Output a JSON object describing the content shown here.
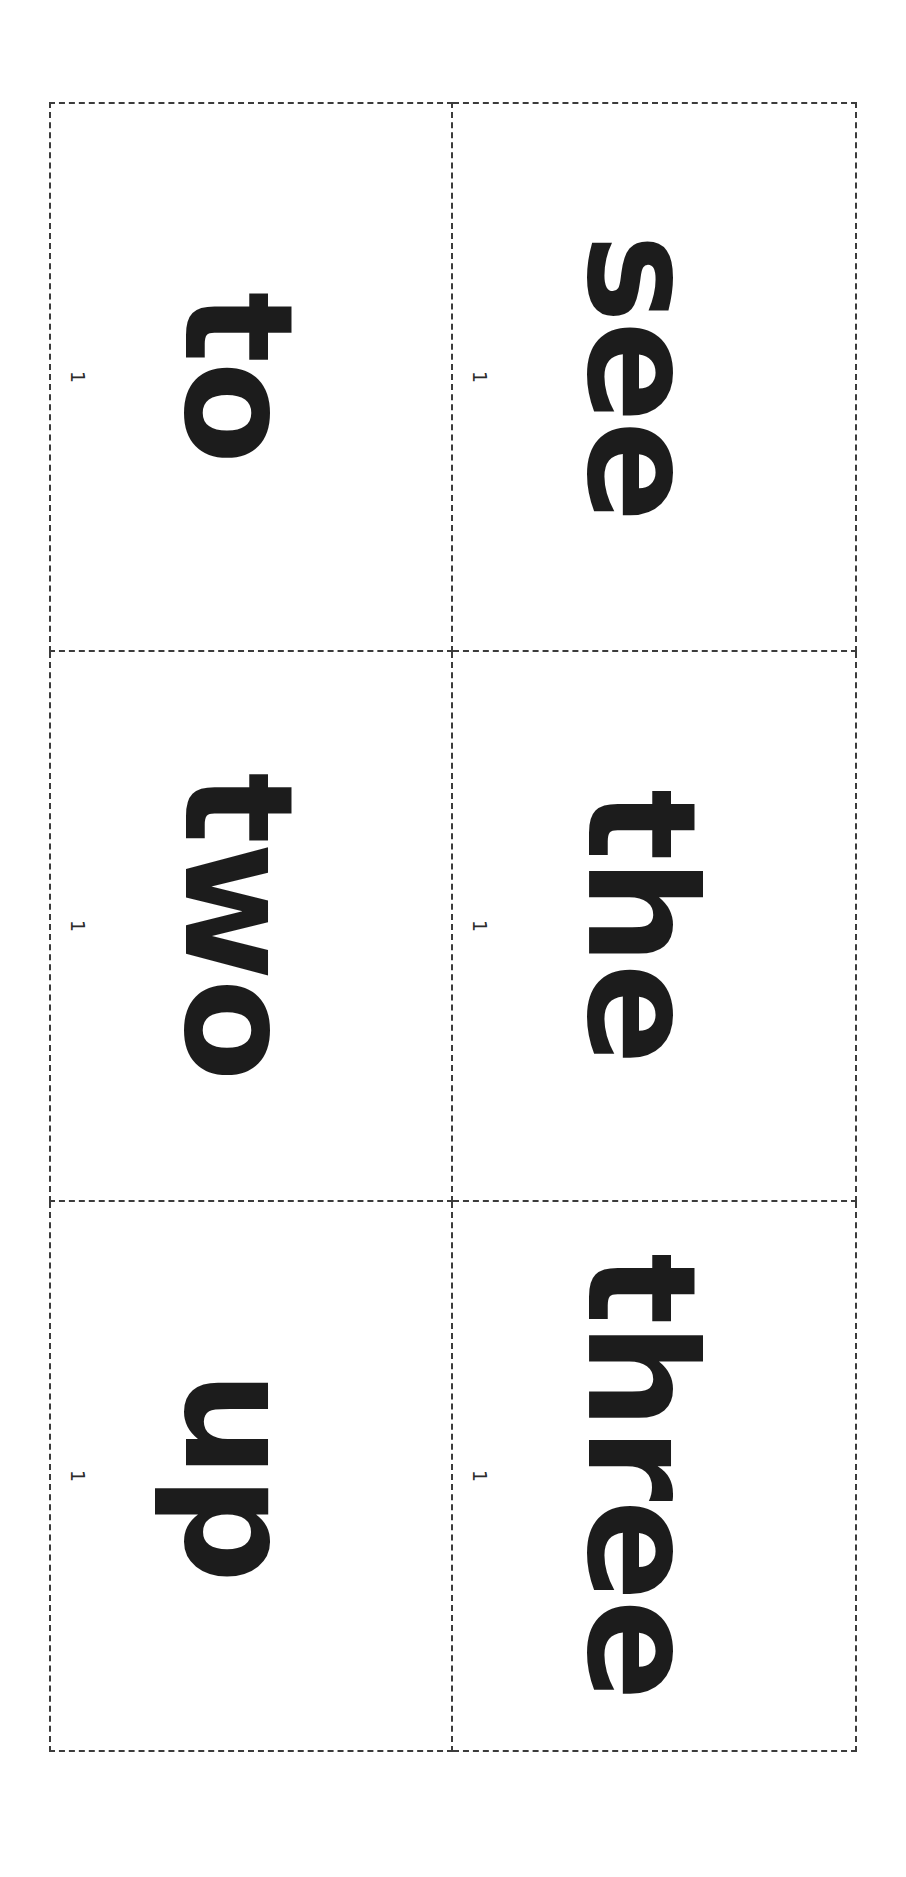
{
  "document": {
    "kind": "sight-word-flashcard-sheet",
    "orientation": "landscape-printed-rotated",
    "page_marker": "1",
    "ink_color": "#1c1c1c",
    "cut_line_color": "#3c3c3c",
    "background_color": "#ffffff",
    "grid": {
      "columns": 2,
      "rows": 3
    }
  },
  "cards": [
    {
      "word": "to",
      "row": 0,
      "column": 0,
      "marker": "1"
    },
    {
      "word": "see",
      "row": 0,
      "column": 1,
      "marker": "1"
    },
    {
      "word": "two",
      "row": 1,
      "column": 0,
      "marker": "1"
    },
    {
      "word": "the",
      "row": 1,
      "column": 1,
      "marker": "1"
    },
    {
      "word": "up",
      "row": 2,
      "column": 0,
      "marker": "1"
    },
    {
      "word": "three",
      "row": 2,
      "column": 1,
      "marker": "1"
    }
  ]
}
